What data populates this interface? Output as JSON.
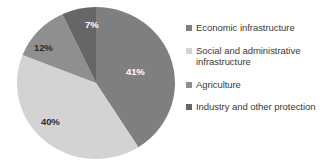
{
  "chart_data": {
    "type": "pie",
    "title": "",
    "subtitle": "",
    "xlabel": "",
    "ylabel": "",
    "grid": false,
    "legend_position": "right",
    "start_angle_deg": 0,
    "direction": "clockwise",
    "categories": [
      "Economic infrastructure",
      "Social and administrative infrastructure",
      "Agriculture",
      "Industry and other protection"
    ],
    "values": [
      41,
      40,
      12,
      7
    ],
    "value_unit": "%",
    "data_labels": [
      "41%",
      "40%",
      "12%",
      "7%"
    ],
    "colors": [
      "#7f7f7f",
      "#d3d3d3",
      "#8f8f8f",
      "#666666"
    ],
    "slices": [
      {
        "label": "Economic infrastructure",
        "value": 41,
        "data_label": "41%",
        "color": "#7f7f7f",
        "label_color": "light"
      },
      {
        "label": "Social and administrative infrastructure",
        "value": 40,
        "data_label": "40%",
        "color": "#d3d3d3",
        "label_color": "dark"
      },
      {
        "label": "Agriculture",
        "value": 12,
        "data_label": "12%",
        "color": "#8f8f8f",
        "label_color": "dark"
      },
      {
        "label": "Industry and other protection",
        "value": 7,
        "data_label": "7%",
        "color": "#666666",
        "label_color": "light"
      }
    ]
  },
  "legend": {
    "items": [
      {
        "label": "Economic infrastructure",
        "color": "#7f7f7f"
      },
      {
        "label": "Social and administrative infrastructure",
        "color": "#d3d3d3"
      },
      {
        "label": "Agriculture",
        "color": "#8f8f8f"
      },
      {
        "label": "Industry and other protection",
        "color": "#666666"
      }
    ]
  }
}
